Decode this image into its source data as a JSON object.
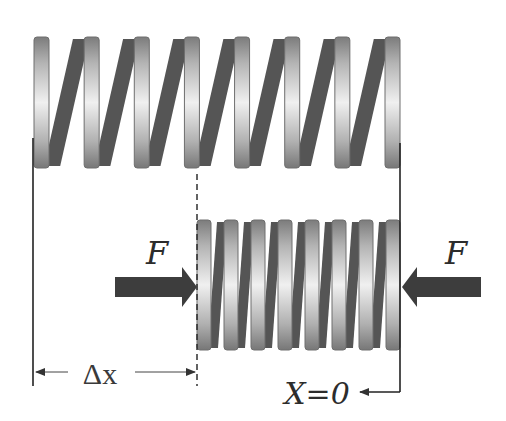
{
  "diagram": {
    "colors": {
      "wire": "#555555",
      "coil_edge": "#6e6e6e",
      "coil_light": "#f2f2f2",
      "coil_dark": "#8a8a8a",
      "arrow": "#3d3d3d",
      "line": "#222222",
      "text": "#2c2c2c"
    },
    "relaxed_spring": {
      "coil_count": 8
    },
    "compressed_spring": {
      "coil_count": 8
    },
    "labels": {
      "force_left": "F",
      "force_right": "F",
      "displacement": "Δx",
      "origin": "X=0"
    },
    "force_left_direction": "right",
    "force_right_direction": "left"
  }
}
